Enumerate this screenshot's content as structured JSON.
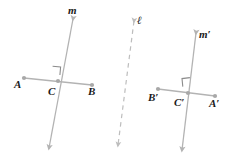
{
  "figure": {
    "type": "geometry-diagram",
    "background_color": "#ffffff",
    "stroke_color": "#b3b3b3",
    "label_color": "#1a1a1a",
    "canvas": {
      "width": 238,
      "height": 165
    }
  },
  "left_figure": {
    "line_m": {
      "label": "m",
      "label_x": 68,
      "label_y": 14,
      "x1": 73,
      "y1": 19,
      "x2": 49,
      "y2": 148,
      "style": "solid",
      "arrows": "both"
    },
    "segment_AB": {
      "x1": 24,
      "y1": 78,
      "x2": 92,
      "y2": 85,
      "style": "solid",
      "endpoints": "dots"
    },
    "point_A": {
      "label": "A",
      "x": 24,
      "y": 78,
      "label_x": 14,
      "label_y": 88
    },
    "point_C": {
      "label": "C",
      "x": 58,
      "y": 81,
      "label_x": 48,
      "label_y": 95
    },
    "point_B": {
      "label": "B",
      "x": 92,
      "y": 85,
      "label_x": 88,
      "label_y": 95
    },
    "right_angle_marker": {
      "x": 52,
      "y": 66,
      "size": 8,
      "corner": "upper-left-of-C"
    }
  },
  "mirror_line": {
    "label": "ℓ",
    "label_x": 137,
    "label_y": 24,
    "x1": 134,
    "y1": 21,
    "x2": 118,
    "y2": 145,
    "style": "dashed",
    "arrows": "both"
  },
  "right_figure": {
    "line_m_prime": {
      "label": "m′",
      "label_x": 199,
      "label_y": 38,
      "x1": 196,
      "y1": 33,
      "x2": 182,
      "y2": 150,
      "style": "solid",
      "arrows": "both"
    },
    "segment_BA_prime": {
      "x1": 158,
      "y1": 89,
      "x2": 215,
      "y2": 96,
      "style": "solid",
      "endpoints": "dots"
    },
    "point_B_prime": {
      "label": "B′",
      "x": 158,
      "y": 89,
      "label_x": 148,
      "label_y": 101
    },
    "point_C_prime": {
      "label": "C′",
      "x": 188,
      "y": 93,
      "label_x": 174,
      "label_y": 106
    },
    "point_A_prime": {
      "label": "A′",
      "x": 215,
      "y": 96,
      "label_x": 209,
      "label_y": 107
    },
    "right_angle_marker": {
      "x": 190,
      "y": 78,
      "size": 8,
      "corner": "upper-right-of-C-prime"
    }
  }
}
